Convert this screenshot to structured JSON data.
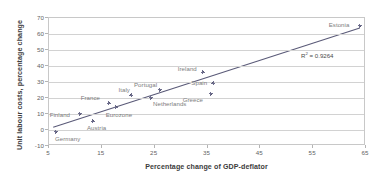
{
  "chart_data": {
    "type": "scatter",
    "title": "",
    "xlabel": "Percentage change of GDP-deflator",
    "ylabel": "Unit labour costs, percentage change",
    "xlim": [
      5,
      65
    ],
    "ylim": [
      -10,
      70
    ],
    "xticks": [
      5,
      15,
      25,
      35,
      45,
      55,
      65
    ],
    "yticks": [
      -10,
      0,
      10,
      20,
      30,
      40,
      50,
      60,
      70
    ],
    "grid": true,
    "legend": "none",
    "annotation": "R² = 0.9264",
    "annotation_r2_value": 0.9264,
    "trendline": {
      "type": "linear",
      "x": [
        5.8,
        64.2
      ],
      "y": [
        0.6,
        63.6
      ]
    },
    "points": [
      {
        "label": "Germany",
        "x": 6.5,
        "y": -1.8,
        "label_dx": -1,
        "label_dy": 7
      },
      {
        "label": "Finland",
        "x": 11.0,
        "y": 9.5,
        "label_dx": -30,
        "label_dy": 1
      },
      {
        "label": "Austria",
        "x": 13.5,
        "y": 4.7,
        "label_dx": -6,
        "label_dy": 7
      },
      {
        "label": "France",
        "x": 16.5,
        "y": 16.0,
        "label_dx": -28,
        "label_dy": -5
      },
      {
        "label": "Eurozone",
        "x": 17.8,
        "y": 13.5,
        "label_dx": -10,
        "label_dy": 8
      },
      {
        "label": "Italy",
        "x": 20.8,
        "y": 21.0,
        "label_dx": -13,
        "label_dy": -5
      },
      {
        "label": "Netherlands",
        "x": 24.5,
        "y": 19.5,
        "label_dx": 2,
        "label_dy": 6
      },
      {
        "label": "Portugal",
        "x": 26.2,
        "y": 24.5,
        "label_dx": -26,
        "label_dy": -5
      },
      {
        "label": "Ireland",
        "x": 34.3,
        "y": 35.5,
        "label_dx": -25,
        "label_dy": -3
      },
      {
        "label": "Greece",
        "x": 35.8,
        "y": 22.0,
        "label_dx": -28,
        "label_dy": 6
      },
      {
        "label": "Spain",
        "x": 36.3,
        "y": 28.5,
        "label_dx": -22,
        "label_dy": 0
      },
      {
        "label": "Estonia",
        "x": 64.0,
        "y": 64.5,
        "label_dx": -31,
        "label_dy": -1
      }
    ],
    "colors": {
      "marker": "#6d6d8c",
      "trendline": "#5a5a78",
      "grid": "#d2d2d2",
      "frame": "#c8c8c8",
      "tick_text": "#636363",
      "axis_title": "#3c3c3c",
      "point_label": "#7d7d7d"
    }
  }
}
